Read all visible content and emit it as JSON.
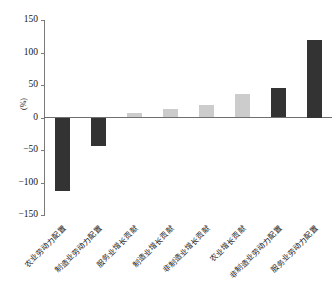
{
  "chart_data": {
    "type": "bar",
    "title": "",
    "subtitle": "",
    "xlabel": "",
    "ylabel": "(%)",
    "ylim": [
      -150,
      150
    ],
    "yticks": [
      150,
      100,
      50,
      0,
      -50,
      -100,
      -150
    ],
    "ytick_labels": [
      "150",
      "100",
      "50",
      "0",
      "−50",
      "−100",
      "−150"
    ],
    "grid": false,
    "legend": "none",
    "categories": [
      "农业劳动力配置",
      "制造业劳动力配置",
      "服务业增长贡献",
      "制造业增长贡献",
      "非制造业增长贡献",
      "农业增长贡献",
      "非制造业劳动力配置",
      "服务业劳动力配置"
    ],
    "values": [
      -113,
      -44,
      7,
      13,
      19,
      36,
      46,
      120
    ],
    "bar_colors": [
      "#333333",
      "#333333",
      "#cccccc",
      "#cccccc",
      "#cccccc",
      "#cccccc",
      "#333333",
      "#333333"
    ],
    "colors": {
      "dark_bar": "#333333",
      "light_bar": "#cccccc",
      "axis": "#6f6f6f",
      "text": "#1a1a1a",
      "background": "#ffffff"
    }
  }
}
